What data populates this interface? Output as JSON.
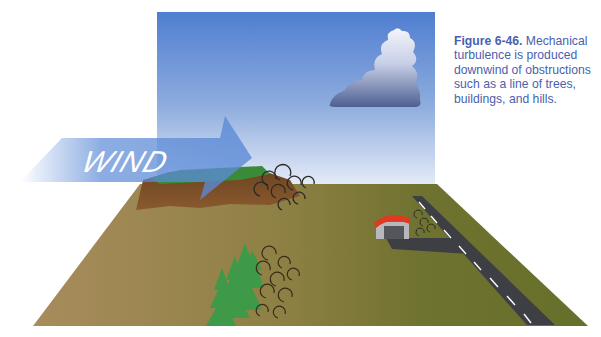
{
  "figure": {
    "number": "Figure 6-46.",
    "caption": " Mechanical turbulence is produced downwind of obstructions such as a line of trees, buildings, and hills."
  },
  "illustration": {
    "wind_label": "WIND",
    "elements": [
      "sky-panel",
      "cumulus-cloud",
      "wind-arrow",
      "hill",
      "ground-plane",
      "tree-line",
      "hangar",
      "runway",
      "taxiway",
      "turbulence-eddies"
    ]
  },
  "colors": {
    "sky_top": "#4f7ed0",
    "sky_bottom": "#e4ebf7",
    "ground": "#7c7a3c",
    "ground_near": "#a88c5c",
    "hill_brown": "#7a4a24",
    "hill_grass": "#3b8a3a",
    "trees": "#3e9a48",
    "runway": "#3e3f45",
    "hangar_roof": "#e0391f",
    "wind_arrow": "#5b8ad6",
    "caption_text": "#4a5fae"
  }
}
